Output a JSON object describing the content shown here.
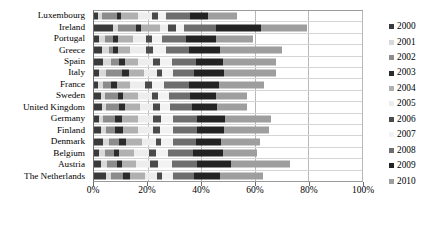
{
  "chart_data": {
    "type": "bar",
    "orientation": "horizontal",
    "stacked": true,
    "title": "",
    "xlabel": "",
    "ylabel": "",
    "xlim": [
      0,
      100
    ],
    "xticks": [
      0,
      20,
      40,
      60,
      80,
      100
    ],
    "xtick_labels": [
      "0%",
      "20%",
      "40%",
      "60%",
      "80%",
      "100%"
    ],
    "grid": true,
    "legend_position": "right",
    "categories": [
      "Luxembourg",
      "Ireland",
      "Portugal",
      "Greece",
      "Spain",
      "Italy",
      "France",
      "Sweden",
      "United Kingdom",
      "Germany",
      "Finland",
      "Denmark",
      "Belgium",
      "Austria",
      "The Netherlands"
    ],
    "series": [
      {
        "name": "2000",
        "color": "#3a3a3a",
        "values": [
          1.5,
          7.0,
          2.0,
          3.0,
          3.5,
          2.0,
          1.5,
          2.5,
          3.0,
          2.0,
          2.5,
          3.5,
          2.0,
          2.5,
          4.5
        ]
      },
      {
        "name": "2001",
        "color": "#d8d8d8",
        "values": [
          1.5,
          2.0,
          2.0,
          2.5,
          3.0,
          2.5,
          2.0,
          1.5,
          1.5,
          1.5,
          2.0,
          2.0,
          2.0,
          2.5,
          2.0
        ]
      },
      {
        "name": "2002",
        "color": "#8c8c8c",
        "values": [
          5.5,
          6.5,
          3.0,
          1.5,
          3.0,
          6.0,
          3.0,
          5.0,
          5.0,
          4.5,
          3.5,
          4.0,
          3.5,
          3.5,
          4.5
        ]
      },
      {
        "name": "2003",
        "color": "#2b2b2b",
        "values": [
          1.5,
          2.0,
          2.0,
          2.0,
          2.0,
          2.5,
          2.0,
          2.0,
          2.0,
          2.5,
          3.0,
          2.5,
          2.0,
          2.0,
          2.5
        ]
      },
      {
        "name": "2004",
        "color": "#b0b0b0",
        "values": [
          6.5,
          7.0,
          5.5,
          4.5,
          5.0,
          5.5,
          5.0,
          5.5,
          5.5,
          6.0,
          5.5,
          6.0,
          5.5,
          5.0,
          5.5
        ]
      },
      {
        "name": "2005",
        "color": "#ededed",
        "values": [
          5.0,
          3.0,
          5.0,
          6.0,
          5.5,
          5.0,
          5.5,
          5.0,
          5.0,
          5.5,
          5.5,
          5.0,
          5.5,
          5.5,
          4.5
        ]
      },
      {
        "name": "2006",
        "color": "#4a4a4a",
        "values": [
          2.5,
          3.0,
          2.0,
          2.5,
          2.5,
          2.0,
          2.5,
          2.5,
          2.5,
          3.0,
          2.5,
          2.0,
          2.5,
          3.0,
          2.0
        ]
      },
      {
        "name": "2007",
        "color": "#f2f2f2",
        "values": [
          3.0,
          3.0,
          4.0,
          5.0,
          4.5,
          4.0,
          4.5,
          4.0,
          4.0,
          4.5,
          5.0,
          4.5,
          4.5,
          5.0,
          4.0
        ]
      },
      {
        "name": "2008",
        "color": "#6e6e6e",
        "values": [
          9.0,
          12.0,
          9.0,
          8.5,
          9.0,
          8.0,
          9.5,
          8.0,
          8.0,
          9.0,
          9.0,
          8.5,
          9.5,
          9.5,
          8.0
        ]
      },
      {
        "name": "2009",
        "color": "#232323",
        "values": [
          6.5,
          17.0,
          11.0,
          11.5,
          10.0,
          11.0,
          11.0,
          9.5,
          9.5,
          10.5,
          10.0,
          9.5,
          11.0,
          12.5,
          9.5
        ]
      },
      {
        "name": "2010",
        "color": "#9e9e9e",
        "values": [
          11.0,
          17.0,
          14.0,
          23.0,
          20.0,
          19.5,
          17.0,
          11.5,
          11.0,
          17.0,
          17.0,
          14.5,
          13.0,
          22.0,
          16.0
        ]
      }
    ],
    "category_totals": [
      53.5,
      79.5,
      59.5,
      70.0,
      68.0,
      68.0,
      63.5,
      57.0,
      57.0,
      66.0,
      65.5,
      62.0,
      61.0,
      73.0,
      63.0
    ]
  }
}
